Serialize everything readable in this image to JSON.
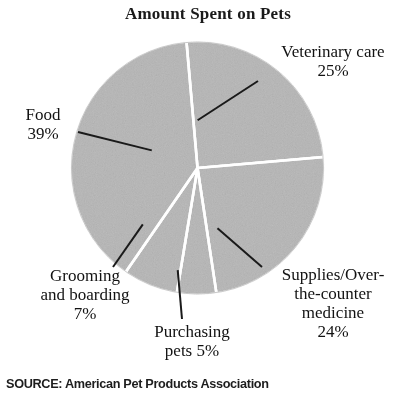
{
  "chart_data": {
    "type": "pie",
    "title": "Amount Spent on Pets",
    "source": "SOURCE: American Pet Products Association",
    "unit": "%",
    "legend_position": "callout-labels",
    "grid": false,
    "fill_color": "#b6b6b6",
    "separator_color": "#ffffff",
    "categories": [
      "Veterinary care",
      "Supplies/Over-the-counter medicine",
      "Purchasing pets",
      "Grooming and boarding",
      "Food"
    ],
    "values": [
      25,
      24,
      5,
      7,
      39
    ],
    "slices": [
      {
        "name": "veterinary-care",
        "label": "Veterinary care\n25%",
        "label_lines": [
          "Veterinary care",
          "25%"
        ],
        "value": 25,
        "value_text": "25%",
        "start_angle": -5,
        "sweep": 90
      },
      {
        "name": "supplies-otc",
        "label": "Supplies/Over-\nthe-counter\nmedicine\n24%",
        "label_lines": [
          "Supplies/Over-",
          "the-counter",
          "medicine",
          "24%"
        ],
        "value": 24,
        "value_text": "24%",
        "start_angle": 85,
        "sweep": 86.4
      },
      {
        "name": "purchasing-pets",
        "label": "Purchasing\npets 5%",
        "label_lines": [
          "Purchasing",
          "pets 5%"
        ],
        "value": 5,
        "value_text": "5%",
        "start_angle": 171.4,
        "sweep": 18
      },
      {
        "name": "grooming-and-boarding",
        "label": "Grooming\nand boarding\n7%",
        "label_lines": [
          "Grooming",
          "and boarding",
          "7%"
        ],
        "value": 7,
        "value_text": "7%",
        "start_angle": 189.4,
        "sweep": 25.2
      },
      {
        "name": "food",
        "label": "Food\n39%",
        "label_lines": [
          "Food",
          "39%"
        ],
        "value": 39,
        "value_text": "39%",
        "start_angle": 214.6,
        "sweep": 140.4
      }
    ]
  },
  "chart": {
    "title": "Amount Spent on Pets",
    "source": "SOURCE: American Pet Products Association",
    "labels": {
      "veterinary": "Veterinary care\n25%",
      "food": "Food\n39%",
      "grooming": "Grooming\nand boarding\n7%",
      "purchasing": "Purchasing\npets 5%",
      "supplies": "Supplies/Over-\nthe-counter\nmedicine\n24%"
    }
  }
}
